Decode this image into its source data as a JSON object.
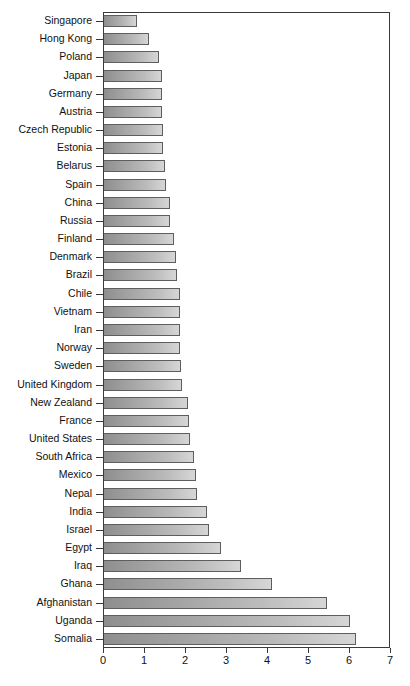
{
  "chart_data": {
    "type": "bar",
    "orientation": "horizontal",
    "title": "",
    "subtitle": "",
    "xlabel": "",
    "ylabel": "",
    "xlim": [
      0,
      7
    ],
    "ylim": null,
    "grid": false,
    "legend": null,
    "legend_position": "none",
    "xticks": [
      "0",
      "1",
      "2",
      "3",
      "4",
      "5",
      "6",
      "7"
    ],
    "xtick_values": [
      0,
      1,
      2,
      3,
      4,
      5,
      6,
      7
    ],
    "categories": [
      "Singapore",
      "Hong Kong",
      "Poland",
      "Japan",
      "Germany",
      "Austria",
      "Czech Republic",
      "Estonia",
      "Belarus",
      "Spain",
      "China",
      "Russia",
      "Finland",
      "Denmark",
      "Brazil",
      "Chile",
      "Vietnam",
      "Iran",
      "Norway",
      "Sweden",
      "United Kingdom",
      "New Zealand",
      "France",
      "United States",
      "South Africa",
      "Mexico",
      "Nepal",
      "India",
      "Israel",
      "Egypt",
      "Iraq",
      "Ghana",
      "Afghanistan",
      "Uganda",
      "Somalia"
    ],
    "values": [
      0.8,
      1.1,
      1.35,
      1.42,
      1.42,
      1.42,
      1.45,
      1.45,
      1.48,
      1.5,
      1.6,
      1.62,
      1.7,
      1.75,
      1.78,
      1.85,
      1.85,
      1.85,
      1.85,
      1.88,
      1.9,
      2.05,
      2.08,
      2.1,
      2.2,
      2.25,
      2.28,
      2.5,
      2.55,
      2.85,
      3.35,
      4.1,
      5.45,
      6.0,
      6.15
    ],
    "series": [
      {
        "name": "value",
        "values": [
          0.8,
          1.1,
          1.35,
          1.42,
          1.42,
          1.42,
          1.45,
          1.45,
          1.48,
          1.5,
          1.6,
          1.62,
          1.7,
          1.75,
          1.78,
          1.85,
          1.85,
          1.85,
          1.85,
          1.88,
          1.9,
          2.05,
          2.08,
          2.1,
          2.2,
          2.25,
          2.28,
          2.5,
          2.55,
          2.85,
          3.35,
          4.1,
          5.45,
          6.0,
          6.15
        ]
      }
    ]
  },
  "caption": {
    "text": ""
  },
  "style": {
    "bar_fill_dark": "#8e8e8e",
    "bar_fill_light": "#d6d6d6",
    "bar_border": "#5e5e5e",
    "frame_color": "#3a3a3a",
    "text_color": "#111111",
    "background": "#ffffff"
  }
}
